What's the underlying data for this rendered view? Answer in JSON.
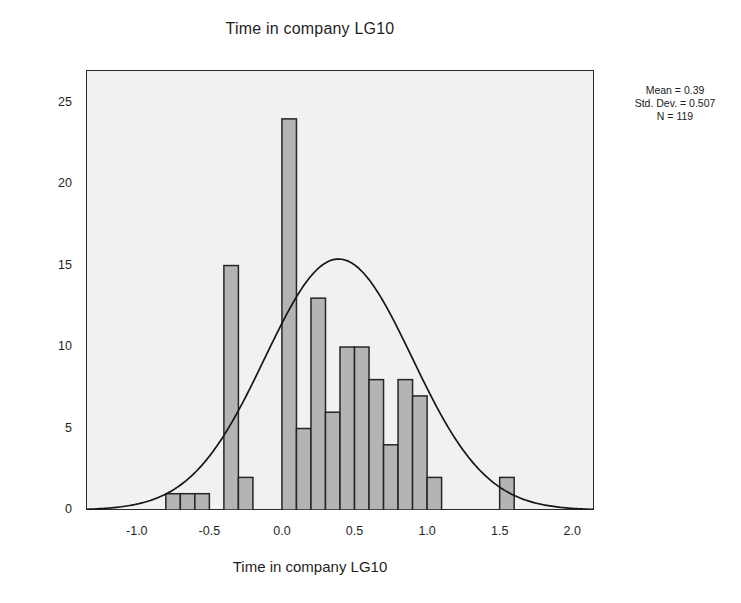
{
  "chart_data": {
    "type": "bar",
    "title": "Time in company LG10",
    "xlabel": "Time in company LG10",
    "ylabel": "Frequency",
    "xlim": [
      -1.35,
      2.15
    ],
    "ylim": [
      0,
      27
    ],
    "grid": false,
    "legend": null,
    "bin_width": 0.1,
    "x": [
      -0.75,
      -0.65,
      -0.55,
      -0.35,
      -0.25,
      -0.15,
      0.05,
      0.15,
      0.25,
      0.35,
      0.45,
      0.55,
      0.65,
      0.75,
      0.85,
      0.95,
      1.05,
      1.15,
      1.25,
      1.55
    ],
    "values": [
      1,
      1,
      1,
      15,
      2,
      0,
      24,
      5,
      13,
      6,
      10,
      10,
      8,
      4,
      8,
      7,
      2,
      0,
      0,
      2
    ],
    "xticks": [
      "-1.0",
      "-0.5",
      "0.0",
      "0.5",
      "1.0",
      "1.5",
      "2.0"
    ],
    "xtick_values": [
      -1.0,
      -0.5,
      0.0,
      0.5,
      1.0,
      1.5,
      2.0
    ],
    "yticks": [
      "0",
      "5",
      "10",
      "15",
      "20",
      "25"
    ],
    "ytick_values": [
      0,
      5,
      10,
      15,
      20,
      25
    ],
    "overlay": {
      "name": "normal-curve",
      "mean": 0.39,
      "std_dev": 0.507,
      "n": 119,
      "peak_value": 15.4,
      "peak_x": 0.15
    },
    "colors": {
      "bar_fill": "#b4b4b4",
      "bar_edge": "#262626",
      "curve": "#161616",
      "plot_background": "#f1f1f1",
      "frame": "#2a2a2a",
      "text": "#1f1f1f"
    }
  },
  "stats": {
    "mean": "Mean = 0.39",
    "std_dev": "Std. Dev. = 0.507",
    "n": "N = 119"
  }
}
